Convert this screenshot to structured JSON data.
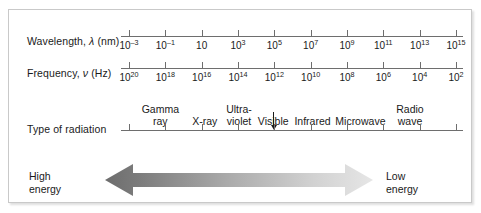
{
  "figure": {
    "border_color": "#c9c9c9",
    "background": "#ffffff"
  },
  "rows": {
    "wavelength": {
      "label_prefix": "Wavelength, ",
      "label_symbol": "λ",
      "label_suffix": " (nm)"
    },
    "frequency": {
      "label_prefix": "Frequency, ",
      "label_symbol": "ν",
      "label_suffix": " (Hz)"
    },
    "radiation": {
      "label": "Type of radiation"
    }
  },
  "chart_data": {
    "type": "diagram",
    "axes": [
      {
        "name": "wavelength",
        "label": "Wavelength, λ (nm)",
        "unit": "nm",
        "base": 10,
        "exponents": [
          -3,
          -1,
          1,
          3,
          5,
          7,
          9,
          11,
          13,
          15
        ],
        "tick_labels": [
          "10⁻³",
          "10⁻¹",
          "10",
          "10³",
          "10⁵",
          "10⁷",
          "10⁹",
          "10¹¹",
          "10¹³",
          "10¹⁵"
        ],
        "direction": "increasing-left-to-right"
      },
      {
        "name": "frequency",
        "label": "Frequency, ν (Hz)",
        "unit": "Hz",
        "base": 10,
        "exponents": [
          20,
          18,
          16,
          14,
          12,
          10,
          8,
          6,
          4,
          2
        ],
        "tick_labels": [
          "10²⁰",
          "10¹⁸",
          "10¹⁶",
          "10¹⁴",
          "10¹²",
          "10¹⁰",
          "10⁸",
          "10⁶",
          "10⁴",
          "10²"
        ],
        "direction": "decreasing-left-to-right"
      }
    ],
    "bands": [
      {
        "name": "Gamma ray",
        "lines": [
          "Gamma",
          "ray"
        ],
        "center_fraction": 0.115
      },
      {
        "name": "X-ray",
        "lines": [
          "X-ray"
        ],
        "center_fraction": 0.245
      },
      {
        "name": "Ultraviolet",
        "lines": [
          "Ultra-",
          "violet"
        ],
        "center_fraction": 0.345
      },
      {
        "name": "Visible",
        "lines": [
          "Visible"
        ],
        "center_fraction": 0.445,
        "pointer": true
      },
      {
        "name": "Infrared",
        "lines": [
          "Infrared"
        ],
        "center_fraction": 0.56
      },
      {
        "name": "Microwave",
        "lines": [
          "Microwave"
        ],
        "center_fraction": 0.7
      },
      {
        "name": "Radio wave",
        "lines": [
          "Radio",
          "wave"
        ],
        "center_fraction": 0.845
      }
    ],
    "energy_arrow": {
      "type": "double-headed-gradient",
      "left_label_lines": [
        "High",
        "energy"
      ],
      "right_label_lines": [
        "Low",
        "energy"
      ],
      "left_color": "#6d6d6d",
      "right_color": "#e2e2e2",
      "direction": "high-energy-left-to-low-energy-right"
    }
  },
  "tick_labels_wavelength": [
    {
      "mantissa": "10",
      "exp": "–3"
    },
    {
      "mantissa": "10",
      "exp": "–1"
    },
    {
      "mantissa": "10",
      "exp": ""
    },
    {
      "mantissa": "10",
      "exp": "3"
    },
    {
      "mantissa": "10",
      "exp": "5"
    },
    {
      "mantissa": "10",
      "exp": "7"
    },
    {
      "mantissa": "10",
      "exp": "9"
    },
    {
      "mantissa": "10",
      "exp": "11"
    },
    {
      "mantissa": "10",
      "exp": "13"
    },
    {
      "mantissa": "10",
      "exp": "15"
    }
  ],
  "tick_labels_frequency": [
    {
      "mantissa": "10",
      "exp": "20"
    },
    {
      "mantissa": "10",
      "exp": "18"
    },
    {
      "mantissa": "10",
      "exp": "16"
    },
    {
      "mantissa": "10",
      "exp": "14"
    },
    {
      "mantissa": "10",
      "exp": "12"
    },
    {
      "mantissa": "10",
      "exp": "10"
    },
    {
      "mantissa": "10",
      "exp": "8"
    },
    {
      "mantissa": "10",
      "exp": "6"
    },
    {
      "mantissa": "10",
      "exp": "4"
    },
    {
      "mantissa": "10",
      "exp": "2"
    }
  ],
  "energy": {
    "high_line1": "High",
    "high_line2": "energy",
    "low_line1": "Low",
    "low_line2": "energy"
  }
}
